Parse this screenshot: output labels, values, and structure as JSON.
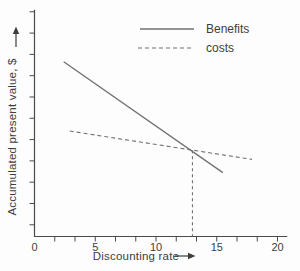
{
  "figure": {
    "background": "#fdfdfd",
    "axis_color": "#4a4a4a",
    "line_color": "#717171",
    "text_color": "#3d3d3d"
  },
  "chart_data": {
    "type": "line",
    "title": "",
    "xlabel": "Discounting rate",
    "ylabel": "Accumulated present value, $",
    "xlim": [
      0,
      20.8
    ],
    "ylim": [
      0,
      10.65
    ],
    "x_major_ticks": [
      0,
      5,
      10,
      15,
      20
    ],
    "x_minor_ticks_per_major": 3,
    "y_tick_values": [
      0.55,
      1.55,
      2.55,
      3.55,
      4.55,
      5.55,
      6.55,
      7.55,
      8.55,
      9.55,
      10.55
    ],
    "y_tick_labels_shown": false,
    "grid": false,
    "legend_position": "top-right-inside",
    "axis_arrows": {
      "x": "right",
      "y": "up"
    },
    "series": [
      {
        "name": "Benefits",
        "style": "solid",
        "points": [
          [
            2.4,
            8.2
          ],
          [
            15.5,
            3.0
          ]
        ]
      },
      {
        "name": "costs",
        "style": "dashed",
        "points": [
          [
            2.9,
            4.95
          ],
          [
            17.9,
            3.62
          ]
        ]
      }
    ],
    "annotations": [
      {
        "type": "dropline-dashed",
        "x": 13.0,
        "y": 4.05,
        "note": "intersection of Benefits and costs lines marked with vertical dashed line to x-axis"
      }
    ]
  }
}
